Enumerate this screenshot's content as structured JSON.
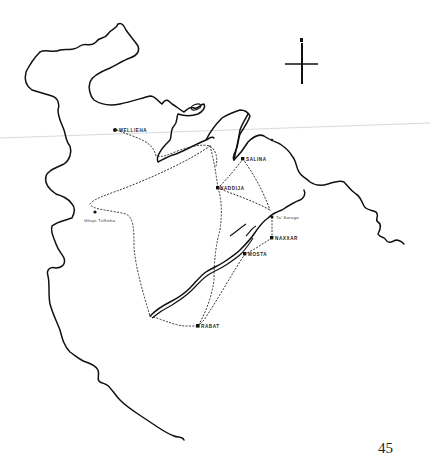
{
  "map": {
    "title": "",
    "north_arrow": {
      "label": "N",
      "icon": "north-arrow-icon"
    },
    "towns": [
      {
        "id": "mellieha",
        "label": "MELLIEHA",
        "x": 115,
        "y": 130
      },
      {
        "id": "salina",
        "label": "SALINA",
        "x": 243,
        "y": 159
      },
      {
        "id": "naxxija",
        "label": "NADDIJA",
        "x": 218,
        "y": 188
      },
      {
        "id": "ta-sarago",
        "label": "Ta' Sarago",
        "x": 273,
        "y": 217
      },
      {
        "id": "naxxar",
        "label": "NAXXAR",
        "x": 272,
        "y": 238
      },
      {
        "id": "mosta",
        "label": "MOSTA",
        "x": 245,
        "y": 254
      },
      {
        "id": "rabat",
        "label": "RABAT",
        "x": 198,
        "y": 326
      },
      {
        "id": "ghajn-tuffieha",
        "label": "Ghajn Tuffieha",
        "x": 95,
        "y": 213
      }
    ],
    "legend": {
      "solid_line": "coastline / escarpment",
      "dotted_line": "route"
    }
  },
  "page": {
    "number": "45"
  }
}
